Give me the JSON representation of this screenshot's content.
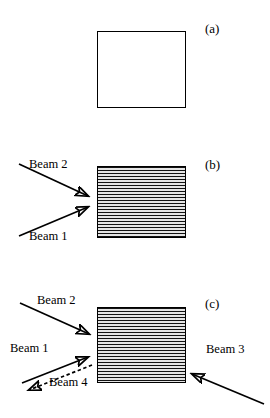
{
  "figure": {
    "background_color": "#ffffff",
    "line_color": "#000000",
    "panels": [
      {
        "id": "a",
        "label": "(a)",
        "sample": {
          "fill": "empty",
          "description": "plain unfilled square outline"
        },
        "beams": []
      },
      {
        "id": "b",
        "label": "(b)",
        "sample": {
          "fill": "striped",
          "description": "square filled with horizontal stripes"
        },
        "beams": [
          {
            "name": "beam-2",
            "label": "Beam 2",
            "style": "solid",
            "direction": "down-right",
            "heads": "single"
          },
          {
            "name": "beam-1",
            "label": "Beam 1",
            "style": "solid",
            "direction": "up-right",
            "heads": "single"
          }
        ]
      },
      {
        "id": "c",
        "label": "(c)",
        "sample": {
          "fill": "striped",
          "description": "square filled with horizontal stripes"
        },
        "beams": [
          {
            "name": "beam-2",
            "label": "Beam 2",
            "style": "solid",
            "direction": "down-right",
            "heads": "single"
          },
          {
            "name": "beam-1",
            "label": "Beam 1",
            "style": "solid",
            "direction": "up-right",
            "heads": "single"
          },
          {
            "name": "beam-4",
            "label": "Beam 4",
            "style": "dashed",
            "direction": "down-left",
            "heads": "single"
          },
          {
            "name": "beam-3",
            "label": "Beam 3",
            "style": "solid",
            "direction": "up-left",
            "heads": "single"
          }
        ]
      }
    ]
  },
  "labels": {
    "panel_a": "(a)",
    "panel_b": "(b)",
    "panel_c": "(c)",
    "b_beam2": "Beam 2",
    "b_beam1": "Beam 1",
    "c_beam2": "Beam 2",
    "c_beam1": "Beam 1",
    "c_beam4": "Beam 4",
    "c_beam3": "Beam 3"
  }
}
